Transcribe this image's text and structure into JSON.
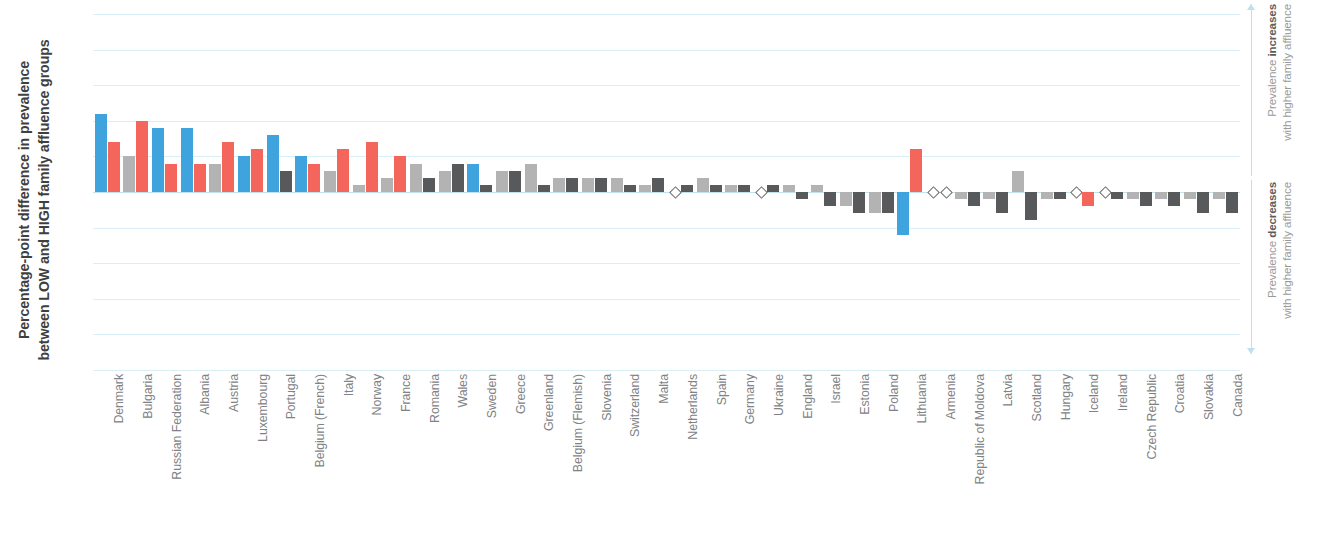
{
  "chart_data": {
    "type": "bar",
    "title": "",
    "xlabel": "",
    "ylabel_lines": [
      "Percentage-point difference in prevalence",
      "between LOW and HIGH family affluence groups"
    ],
    "ylim": [
      -25,
      25
    ],
    "ytick_values": [
      25,
      20,
      15,
      10,
      5,
      0,
      -5,
      -10,
      -15,
      -20,
      -25
    ],
    "ytick_labels": [
      "25",
      "20",
      "15",
      "10",
      "5",
      "0",
      "-5",
      "-10",
      "-15",
      "-20",
      "-25"
    ],
    "grid": true,
    "legend_position": "none",
    "bar_colors": {
      "blue": "#3fa3dd",
      "red": "#f4655c",
      "grey_light": "#b3b3b3",
      "grey_dark": "#58595b",
      "grey_mid": "#8a8c8e"
    },
    "zero_marker": "open-diamond",
    "categories": [
      "Denmark",
      "Bulgaria",
      "Russian Federation",
      "Albania",
      "Austria",
      "Luxembourg",
      "Portugal",
      "Belgium (French)",
      "Italy",
      "Norway",
      "France",
      "Romania",
      "Wales",
      "Sweden",
      "Greece",
      "Greenland",
      "Belgium (Flemish)",
      "Slovenia",
      "Switzerland",
      "Malta",
      "Netherlands",
      "Spain",
      "Germany",
      "Ukraine",
      "England",
      "Israel",
      "Estonia",
      "Poland",
      "Lithuania",
      "Armenia",
      "Republic of Moldova",
      "Latvia",
      "Scotland",
      "Hungary",
      "Iceland",
      "Ireland",
      "Czech Republic",
      "Croatia",
      "Slovakia",
      "Canada"
    ],
    "series": [
      {
        "name": "bar1",
        "values": [
          11,
          5,
          9,
          9,
          4,
          5,
          8,
          5,
          3,
          1,
          2,
          4,
          3,
          4,
          3,
          4,
          2,
          2,
          2,
          1,
          0,
          2,
          1,
          0,
          1,
          1,
          -2,
          -3,
          -6,
          0,
          -1,
          -1,
          3,
          -1,
          0,
          0,
          -1,
          -1,
          -1,
          -1
        ],
        "colors": [
          "blue",
          "grey_light",
          "blue",
          "blue",
          "grey_light",
          "blue",
          "blue",
          "blue",
          "grey_light",
          "grey_light",
          "grey_light",
          "grey_light",
          "grey_light",
          "blue",
          "grey_light",
          "grey_light",
          "grey_light",
          "grey_light",
          "grey_light",
          "grey_light",
          "zero",
          "grey_light",
          "grey_light",
          "zero",
          "grey_light",
          "grey_light",
          "grey_light",
          "grey_light",
          "blue",
          "zero",
          "grey_light",
          "grey_light",
          "grey_light",
          "grey_light",
          "zero",
          "zero",
          "grey_light",
          "grey_light",
          "grey_light",
          "grey_light"
        ]
      },
      {
        "name": "bar2",
        "values": [
          7,
          10,
          4,
          4,
          7,
          6,
          3,
          4,
          6,
          7,
          5,
          2,
          4,
          1,
          3,
          1,
          2,
          2,
          1,
          2,
          1,
          1,
          1,
          1,
          -1,
          -2,
          -3,
          -3,
          6,
          0,
          -2,
          -3,
          -4,
          -1,
          -2,
          -1,
          -2,
          -2,
          -3,
          -3
        ],
        "colors": [
          "red",
          "red",
          "red",
          "red",
          "red",
          "red",
          "grey_dark",
          "red",
          "red",
          "red",
          "red",
          "grey_dark",
          "grey_dark",
          "grey_dark",
          "grey_dark",
          "grey_dark",
          "grey_dark",
          "grey_dark",
          "grey_dark",
          "grey_dark",
          "grey_dark",
          "grey_dark",
          "grey_dark",
          "grey_dark",
          "grey_dark",
          "grey_dark",
          "grey_dark",
          "grey_dark",
          "red",
          "zero",
          "grey_dark",
          "grey_dark",
          "grey_dark",
          "grey_dark",
          "red",
          "grey_dark",
          "grey_dark",
          "grey_dark",
          "grey_dark",
          "grey_dark"
        ]
      }
    ]
  },
  "annotations": {
    "increase": {
      "line1_prefix": "Prevalence ",
      "line1_bold": "increases",
      "line2": "with higher family affluence"
    },
    "decrease": {
      "line1_prefix": "Prevalence ",
      "line1_bold": "decreases",
      "line2": "with higher family affluence"
    }
  }
}
